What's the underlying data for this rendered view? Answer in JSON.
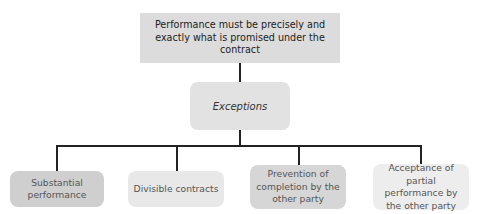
{
  "diagram": {
    "type": "hierarchy-tree",
    "root": {
      "label": "Performance must be precisely and exactly what is promised under the contract"
    },
    "middle": {
      "label": "Exceptions"
    },
    "leaves": [
      {
        "label": "Substantial performance"
      },
      {
        "label": "Divisible contracts"
      },
      {
        "label": "Prevention of completion by the other party"
      },
      {
        "label": "Acceptance of partial performance by the other party"
      }
    ],
    "colors": {
      "root_fill": "#dcdcdc",
      "middle_fill": "#e2e2e2",
      "leaf_fills": [
        "#cfcfcf",
        "#e8e8e8",
        "#d6d6d6",
        "#ededed"
      ],
      "connector": "#222222"
    }
  }
}
